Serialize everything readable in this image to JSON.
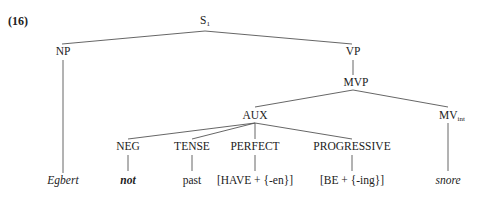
{
  "example_number": "(16)",
  "nodes": {
    "s": {
      "label": "S",
      "sub": "1"
    },
    "np": {
      "label": "NP"
    },
    "vp": {
      "label": "VP"
    },
    "mvp": {
      "label": "MVP"
    },
    "aux": {
      "label": "AUX"
    },
    "mv": {
      "label": "MV",
      "sub": "int"
    },
    "neg": {
      "label": "NEG"
    },
    "tense": {
      "label": "TENSE"
    },
    "perfect": {
      "label": "PERFECT"
    },
    "progressive": {
      "label": "PROGRESSIVE"
    }
  },
  "leaves": {
    "egbert": "Egbert",
    "not": "not",
    "past": "past",
    "have": "[HAVE + {-en}]",
    "be": "[BE + {-ing}]",
    "snore": "snore"
  }
}
